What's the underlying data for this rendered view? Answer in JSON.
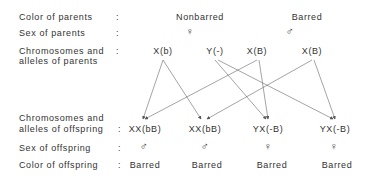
{
  "labels": {
    "color_parents": "Color  of  parents",
    "sex_parents": "Sex  of  parents",
    "chrom_parents_1": "Chromosomes   and",
    "chrom_parents_2": " alleles  of  parents",
    "chrom_offspring_1": "Chromosomes   and",
    "chrom_offspring_2": " alleles  of  offspring",
    "sex_offspring": "Sex  of  offspring",
    "color_offspring": "Color  of  offspring",
    "colon": ":"
  },
  "parents": {
    "female": {
      "color": "Nonbarred",
      "sex_symbol": "♀",
      "chromosomes": [
        "X(b)",
        "Y(-)"
      ]
    },
    "male": {
      "color": "Barred",
      "sex_symbol": "♂",
      "chromosomes": [
        "X(B)",
        "X(B)"
      ]
    }
  },
  "offspring": [
    {
      "chromosomes": "XX(bB)",
      "sex_symbol": "♂",
      "color": "Barred"
    },
    {
      "chromosomes": "XX(bB)",
      "sex_symbol": "♂",
      "color": "Barred"
    },
    {
      "chromosomes": "YX(-B)",
      "sex_symbol": "♀",
      "color": "Barred"
    },
    {
      "chromosomes": "YX(-B)",
      "sex_symbol": "♀",
      "color": "Barred"
    }
  ],
  "colors": {
    "line": "#555555",
    "text": "#333333"
  }
}
